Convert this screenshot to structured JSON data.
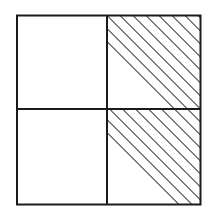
{
  "diagram": {
    "type": "fraction-grid",
    "rows": 2,
    "cols": 2,
    "cells": [
      {
        "row": 0,
        "col": 0,
        "shaded": false
      },
      {
        "row": 0,
        "col": 1,
        "shaded": true
      },
      {
        "row": 1,
        "col": 0,
        "shaded": false
      },
      {
        "row": 1,
        "col": 1,
        "shaded": true
      }
    ],
    "shaded_fraction": "2/4",
    "hatch_direction": "backslash",
    "colors": {
      "border": "#1a1a1a",
      "hatch": "#4a4a4a",
      "background": "#ffffff"
    },
    "geometry": {
      "left": 17,
      "top": 15.5,
      "right": 200.5,
      "bottom": 204.5,
      "mid_x": 107,
      "mid_y": 109,
      "hatch_spacing": 13
    }
  }
}
